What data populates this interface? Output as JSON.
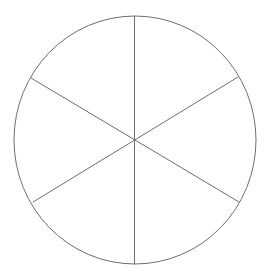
{
  "diagram": {
    "type": "circle-divided-into-sectors",
    "sectors": 6,
    "stroke_color": "#6e6e6e",
    "fill_color": "#ffffff",
    "circle": {
      "cx": 135,
      "cy": 140,
      "rx": 121,
      "ry": 124
    },
    "spokes": [
      {
        "x1": 134.5,
        "y1": 16,
        "x2": 134.5,
        "y2": 264
      },
      {
        "x1": 31,
        "y1": 78,
        "x2": 239,
        "y2": 202
      },
      {
        "x1": 33,
        "y1": 202,
        "x2": 238,
        "y2": 77
      }
    ]
  }
}
